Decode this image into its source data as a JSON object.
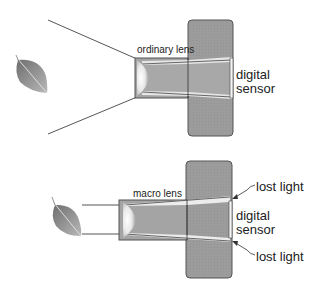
{
  "diagrams": [
    {
      "id": "ordinary",
      "lens_label": "ordinary lens",
      "sensor_label_line1": "digital",
      "sensor_label_line2": "sensor"
    },
    {
      "id": "macro",
      "lens_label": "macro lens",
      "sensor_label_line1": "digital",
      "sensor_label_line2": "sensor",
      "callout_top": "lost light",
      "callout_bottom": "lost light"
    }
  ],
  "colors": {
    "camera_body": "#9a9a9a",
    "lens_body": "#a8a8a8",
    "light_cone": "#e4e4e4",
    "outline": "#444444",
    "text": "#222222"
  }
}
